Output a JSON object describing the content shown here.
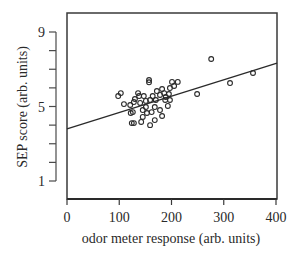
{
  "chart_data": {
    "type": "scatter",
    "title": "",
    "xlabel": "odor meter response (arb. units)",
    "ylabel": "SEP score (arb. units)",
    "xlim": [
      0,
      400
    ],
    "ylim": [
      1,
      9
    ],
    "x_ticks": [
      "0",
      "100",
      "200",
      "300",
      "400"
    ],
    "x_tick_values": [
      0,
      100,
      200,
      300,
      400
    ],
    "y_ticks": [
      "1",
      "5",
      "9"
    ],
    "y_tick_values": [
      1,
      5,
      9
    ],
    "y_minor_tick_values": [
      1,
      2,
      3,
      4,
      5,
      6,
      7,
      8,
      9
    ],
    "grid": false,
    "legend": null,
    "marker": "open-circle",
    "series": [
      {
        "name": "observations",
        "points": [
          [
            98,
            5.56
          ],
          [
            103,
            5.72
          ],
          [
            109,
            5.13
          ],
          [
            122,
            4.65
          ],
          [
            124,
            4.11
          ],
          [
            128,
            4.11
          ],
          [
            128,
            5.24
          ],
          [
            136,
            5.72
          ],
          [
            157,
            6.42
          ],
          [
            157,
            6.3
          ],
          [
            138,
            5.56
          ],
          [
            147,
            5.56
          ],
          [
            151,
            5.3
          ],
          [
            140,
            5.19
          ],
          [
            121,
            5.08
          ],
          [
            145,
            4.81
          ],
          [
            153,
            4.65
          ],
          [
            145,
            4.44
          ],
          [
            142,
            4.17
          ],
          [
            126,
            4.7
          ],
          [
            130,
            5.4
          ],
          [
            170,
            5.35
          ],
          [
            178,
            5.62
          ],
          [
            186,
            5.72
          ],
          [
            197,
            5.99
          ],
          [
            205,
            6.1
          ],
          [
            212,
            6.32
          ],
          [
            201,
            6.32
          ],
          [
            188,
            5.35
          ],
          [
            193,
            5.03
          ],
          [
            178,
            4.81
          ],
          [
            182,
            4.49
          ],
          [
            168,
            4.27
          ],
          [
            159,
            4.0
          ],
          [
            168,
            4.97
          ],
          [
            159,
            5.35
          ],
          [
            164,
            5.56
          ],
          [
            172,
            5.83
          ],
          [
            182,
            5.94
          ],
          [
            189,
            5.51
          ],
          [
            197,
            5.35
          ],
          [
            195,
            5.67
          ],
          [
            151,
            4.97
          ],
          [
            162,
            4.7
          ],
          [
            249,
            5.67
          ],
          [
            276,
            7.55
          ],
          [
            312,
            6.26
          ],
          [
            356,
            6.8
          ]
        ]
      }
    ],
    "regression_line": {
      "x": [
        0,
        408
      ],
      "y": [
        3.8,
        7.33
      ]
    }
  },
  "colors": {
    "ink": "#2a2a2a",
    "background": "#ffffff"
  }
}
